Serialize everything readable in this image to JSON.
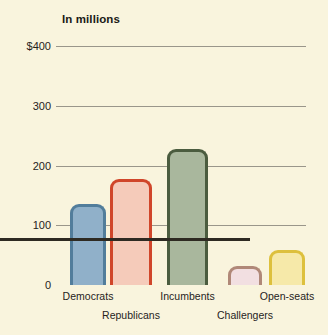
{
  "chart_data": {
    "type": "bar",
    "title": "In millions",
    "subtitle": "",
    "xlabel": "",
    "ylabel": "",
    "ylim": [
      0,
      400
    ],
    "yticks": [
      0,
      100,
      200,
      300,
      400
    ],
    "ytick_labels": [
      "0",
      "100",
      "200",
      "300",
      "$400"
    ],
    "grid": true,
    "legend": "none",
    "categories": [
      "Democrats",
      "Republicans",
      "Incumbents",
      "Challengers",
      "Open-seats"
    ],
    "values": [
      135,
      177,
      227,
      32,
      59
    ],
    "bars": [
      {
        "label": "Democrats",
        "value": 135,
        "fill": "#90b0c9",
        "stroke": "#527d9b",
        "group_row": 1
      },
      {
        "label": "Republicans",
        "value": 177,
        "fill": "#f5cbba",
        "stroke": "#d0462a",
        "group_row": 2
      },
      {
        "label": "Incumbents",
        "value": 227,
        "fill": "#a9b79d",
        "stroke": "#4b5c3f",
        "group_row": 1
      },
      {
        "label": "Challengers",
        "value": 32,
        "fill": "#f2dfe1",
        "stroke": "#b08878",
        "group_row": 2
      },
      {
        "label": "Open-seats",
        "value": 59,
        "fill": "#f6e9a9",
        "stroke": "#ddc03d",
        "group_row": 1
      }
    ],
    "colors": {
      "background": "#f9f4dd",
      "gridline": "#9a968a",
      "axis": "#2e2a22",
      "text": "#26231c"
    }
  }
}
